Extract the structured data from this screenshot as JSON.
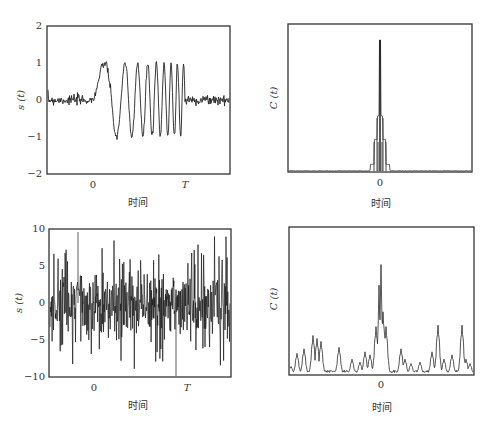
{
  "chart_data": [
    {
      "id": "top-left",
      "type": "line",
      "title": "",
      "xlabel": "时间",
      "ylabel": "s (t)",
      "ylim": [
        -2,
        2
      ],
      "yticks": [
        "2",
        "1",
        "0",
        "-1",
        "-2"
      ],
      "xticks": [
        "0",
        "T"
      ],
      "grid": false,
      "description": "Linear FM chirp of amplitude ~1 between t=0 and t=T, low-level noise (~±0.15) outside",
      "series": [
        {
          "name": "chirp + light noise",
          "amplitude": 1.1,
          "noise_level": 0.15,
          "pulse_start": "0",
          "pulse_end": "T",
          "cycles_in_pulse": 16
        }
      ]
    },
    {
      "id": "top-right",
      "type": "line",
      "title": "",
      "xlabel": "时间",
      "ylabel": "C (t)",
      "xticks": [
        "0"
      ],
      "grid": false,
      "description": "Matched-filter (correlation) output with a sharp main peak at 0 and small sidelobes",
      "series": [
        {
          "name": "correlation",
          "peak_position": "0",
          "peak_relative_height": 0.9,
          "sidelobe_relative_height": [
            0.4,
            0.22,
            0.05
          ]
        }
      ]
    },
    {
      "id": "bottom-left",
      "type": "line",
      "title": "",
      "xlabel": "时间",
      "ylabel": "s (t)",
      "ylim": [
        -10,
        10
      ],
      "yticks": [
        "10",
        "5",
        "0",
        "-5",
        "-10"
      ],
      "xticks": [
        "0",
        "T"
      ],
      "grid": false,
      "description": "Same chirp buried in heavy noise; spikes reach about ±9",
      "series": [
        {
          "name": "chirp + heavy noise",
          "noise_level": 4,
          "max_spike": 9.5
        }
      ]
    },
    {
      "id": "bottom-right",
      "type": "line",
      "title": "",
      "xlabel": "时间",
      "ylabel": "C (t)",
      "xticks": [
        "0"
      ],
      "grid": false,
      "description": "Correlation output of noisy signal; main peak at 0 still dominant above noise floor",
      "series": [
        {
          "name": "correlation",
          "peak_position": "0",
          "peak_relative_height": 0.74,
          "noise_peaks_relative_height": [
            0.2,
            0.24
          ]
        }
      ]
    }
  ],
  "labels": {
    "time": "时间",
    "s": "s (t)",
    "c": "C (t)",
    "zero": "0",
    "T": "T",
    "tl_yticks": [
      "2",
      "1",
      "0",
      "−1",
      "−2"
    ],
    "bl_yticks": [
      "10",
      "5",
      "0",
      "−5",
      "−10"
    ]
  }
}
